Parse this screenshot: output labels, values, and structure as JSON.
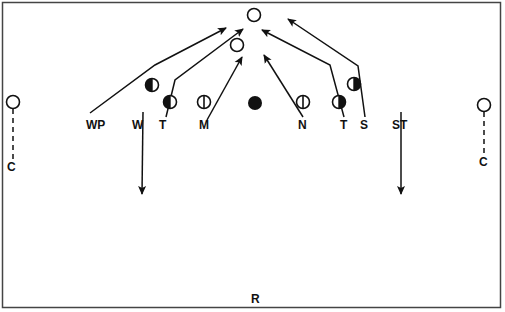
{
  "diagram": {
    "type": "football-defensive-play-diagram",
    "colors": {
      "ink": "#111111",
      "background": "#ffffff",
      "border": "#444444"
    },
    "labels": {
      "wp": "WP",
      "w": "W",
      "t_left": "T",
      "m": "M",
      "n": "N",
      "t_right": "T",
      "s": "S",
      "st": "ST",
      "c_left": "C",
      "c_right": "C",
      "r": "R"
    },
    "players": [
      {
        "id": "top-target",
        "symbol": "open-circle"
      },
      {
        "id": "upper-target",
        "symbol": "open-circle"
      },
      {
        "id": "left-end-half",
        "symbol": "half-filled-left"
      },
      {
        "id": "left-tackle",
        "symbol": "half-filled-left"
      },
      {
        "id": "middle-left",
        "symbol": "circle-with-bar"
      },
      {
        "id": "center-ball",
        "symbol": "filled-circle"
      },
      {
        "id": "middle-right",
        "symbol": "circle-with-bar"
      },
      {
        "id": "right-tackle",
        "symbol": "half-filled-right"
      },
      {
        "id": "right-end-half",
        "symbol": "half-filled-right"
      },
      {
        "id": "left-corner",
        "symbol": "open-circle"
      },
      {
        "id": "right-corner",
        "symbol": "open-circle"
      }
    ]
  }
}
